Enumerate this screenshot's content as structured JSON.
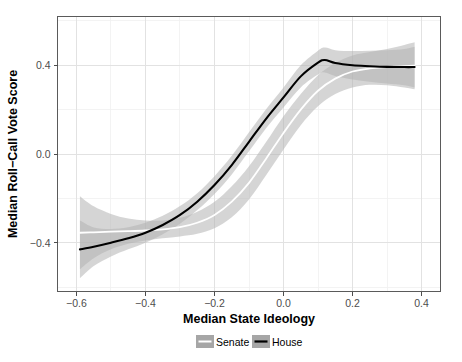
{
  "chart_data": {
    "type": "line",
    "title": "",
    "xlabel": "Median State Ideology",
    "ylabel": "Median Roll−Call Vote Score",
    "xlim": [
      -0.655,
      0.455
    ],
    "ylim": [
      -0.62,
      0.62
    ],
    "xticks": [
      -0.6,
      -0.4,
      -0.2,
      0.0,
      0.2,
      0.4
    ],
    "xticklabels": [
      "−0.6",
      "−0.4",
      "−0.2",
      "0.0",
      "0.2",
      "0.4"
    ],
    "yticks": [
      0.4,
      0.0,
      -0.4
    ],
    "yticklabels": [
      "0.4",
      "0.0",
      "−0.4"
    ],
    "grid": true,
    "grid_minor": true,
    "legend_position": "bottom",
    "legend": [
      "Senate",
      "House"
    ],
    "colors": {
      "senate_line": "#ffffff",
      "house_line": "#000000",
      "band": "#b3b3b3",
      "legend_key_bg": "#a6a6a6",
      "panel_bg": "#ffffff",
      "grid_major": "#e2e2e2",
      "grid_minor": "#f0f0f0",
      "panel_border": "#5a5a5a",
      "tick_text": "#4d4d4d",
      "axis_title": "#000000"
    },
    "series": [
      {
        "name": "Senate",
        "x": [
          -0.59,
          -0.55,
          -0.5,
          -0.45,
          -0.4,
          -0.35,
          -0.3,
          -0.25,
          -0.2,
          -0.15,
          -0.1,
          -0.05,
          0.0,
          0.05,
          0.1,
          0.15,
          0.2,
          0.25,
          0.3,
          0.35,
          0.38
        ],
        "y": [
          -0.355,
          -0.353,
          -0.35,
          -0.348,
          -0.345,
          -0.34,
          -0.33,
          -0.31,
          -0.275,
          -0.215,
          -0.13,
          -0.02,
          0.095,
          0.2,
          0.285,
          0.34,
          0.372,
          0.386,
          0.392,
          0.396,
          0.398
        ],
        "ci_lower": [
          -0.52,
          -0.47,
          -0.43,
          -0.405,
          -0.39,
          -0.38,
          -0.372,
          -0.36,
          -0.335,
          -0.285,
          -0.205,
          -0.095,
          0.02,
          0.13,
          0.215,
          0.27,
          0.3,
          0.312,
          0.31,
          0.3,
          0.292
        ],
        "ci_upper": [
          -0.19,
          -0.236,
          -0.27,
          -0.291,
          -0.3,
          -0.3,
          -0.288,
          -0.26,
          -0.215,
          -0.145,
          -0.055,
          0.055,
          0.17,
          0.27,
          0.355,
          0.41,
          0.444,
          0.46,
          0.474,
          0.492,
          0.504
        ]
      },
      {
        "name": "House",
        "x": [
          -0.59,
          -0.55,
          -0.5,
          -0.45,
          -0.4,
          -0.35,
          -0.3,
          -0.25,
          -0.2,
          -0.15,
          -0.1,
          -0.05,
          0.0,
          0.05,
          0.1,
          0.12,
          0.15,
          0.2,
          0.25,
          0.3,
          0.35,
          0.38
        ],
        "y": [
          -0.43,
          -0.418,
          -0.4,
          -0.38,
          -0.355,
          -0.32,
          -0.275,
          -0.215,
          -0.14,
          -0.05,
          0.055,
          0.16,
          0.255,
          0.35,
          0.412,
          0.424,
          0.41,
          0.4,
          0.396,
          0.393,
          0.392,
          0.392
        ],
        "ci_lower": [
          -0.56,
          -0.505,
          -0.462,
          -0.43,
          -0.4,
          -0.362,
          -0.315,
          -0.253,
          -0.18,
          -0.092,
          0.012,
          0.117,
          0.21,
          0.3,
          0.358,
          0.368,
          0.352,
          0.336,
          0.326,
          0.318,
          0.31,
          0.3
        ],
        "ci_upper": [
          -0.3,
          -0.331,
          -0.338,
          -0.33,
          -0.31,
          -0.278,
          -0.235,
          -0.177,
          -0.1,
          -0.008,
          0.098,
          0.203,
          0.3,
          0.4,
          0.466,
          0.48,
          0.468,
          0.464,
          0.466,
          0.468,
          0.474,
          0.484
        ]
      }
    ]
  },
  "legend": {
    "senate_label": "Senate",
    "house_label": "House"
  },
  "axes": {
    "x_title": "Median State Ideology",
    "y_title": "Median Roll−Call Vote Score"
  }
}
